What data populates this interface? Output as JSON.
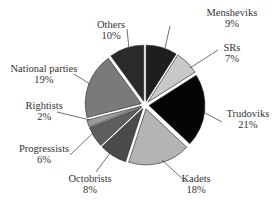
{
  "chart_data": {
    "type": "pie",
    "title": "",
    "exploded": true,
    "start_angle_deg": 0,
    "direction": "clockwise",
    "slices": [
      {
        "name": "Mensheviks",
        "value": 9,
        "label": "9%",
        "color": "#1e1e1e"
      },
      {
        "name": "SRs",
        "value": 7,
        "label": "7%",
        "color": "#c8c8c8"
      },
      {
        "name": "Trudoviks",
        "value": 21,
        "label": "21%",
        "color": "#050505"
      },
      {
        "name": "Kadets",
        "value": 18,
        "label": "18%",
        "color": "#b4b4b4"
      },
      {
        "name": "Octobrists",
        "value": 8,
        "label": "8%",
        "color": "#4a4a4a"
      },
      {
        "name": "Progressists",
        "value": 6,
        "label": "6%",
        "color": "#5e5e5e"
      },
      {
        "name": "Rightists",
        "value": 2,
        "label": "2%",
        "color": "#9a9a9a"
      },
      {
        "name": "National parties",
        "value": 19,
        "label": "19%",
        "color": "#7a7a7a"
      },
      {
        "name": "Others",
        "value": 10,
        "label": "10%",
        "color": "#2a2a2a"
      }
    ]
  },
  "labels": [
    {
      "name": "Mensheviks",
      "pct": "9%",
      "x": 232,
      "y": 7,
      "lx1": 165,
      "ly1": 48,
      "lx2": 170,
      "ly2": 26
    },
    {
      "name": "SRs",
      "pct": "7%",
      "x": 232,
      "y": 42,
      "lx1": 190,
      "ly1": 68,
      "lx2": 218,
      "ly2": 50
    },
    {
      "name": "Trudoviks",
      "pct": "21%",
      "x": 248,
      "y": 108,
      "lx1": 203,
      "ly1": 112,
      "lx2": 222,
      "ly2": 122
    },
    {
      "name": "Kadets",
      "pct": "18%",
      "x": 196,
      "y": 173,
      "lx1": 162,
      "ly1": 160,
      "lx2": 186,
      "ly2": 182
    },
    {
      "name": "Octobrists",
      "pct": "8%",
      "x": 90,
      "y": 173,
      "lx1": 110,
      "ly1": 153,
      "lx2": 96,
      "ly2": 172
    },
    {
      "name": "Progressists",
      "pct": "6%",
      "x": 44,
      "y": 143,
      "lx1": 93,
      "ly1": 133,
      "lx2": 70,
      "ly2": 155
    },
    {
      "name": "Rightists",
      "pct": "2%",
      "x": 44,
      "y": 100,
      "lx1": 90,
      "ly1": 120,
      "lx2": 57,
      "ly2": 112
    },
    {
      "name": "National parties",
      "pct": "19%",
      "x": 44,
      "y": 63,
      "lx1": 90,
      "ly1": 84,
      "lx2": 74,
      "ly2": 74
    },
    {
      "name": "Others",
      "pct": "10%",
      "x": 111,
      "y": 19,
      "lx1": 129,
      "ly1": 49,
      "lx2": 127,
      "ly2": 29
    }
  ],
  "geometry": {
    "cx": 145,
    "cy": 105,
    "r": 56,
    "explode": 4
  }
}
